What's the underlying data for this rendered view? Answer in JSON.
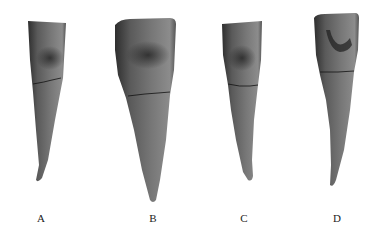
{
  "figure": {
    "panels": [
      {
        "label": "A",
        "label_x": 41
      },
      {
        "label": "B",
        "label_x": 153
      },
      {
        "label": "C",
        "label_x": 244
      },
      {
        "label": "D",
        "label_x": 337
      }
    ],
    "colors": {
      "tooth_dark": "#3a3a3a",
      "tooth_mid": "#6e6e6e",
      "tooth_light": "#9a9a9a",
      "line": "#111111",
      "background": "#ffffff"
    }
  }
}
